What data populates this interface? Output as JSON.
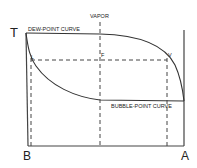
{
  "diagram": {
    "axis_labels": {
      "y": "T",
      "left_bottom": "B",
      "right_bottom": "A"
    },
    "region_label": "VAPOR",
    "curves": {
      "dew_point": "DEW-POINT CURVE",
      "bubble_point": "BUBBLE-POINT CURVE"
    },
    "points": {
      "liquid": "L",
      "feed": "F",
      "vapor": "V"
    },
    "colors": {
      "line": "#333333",
      "background": "#ffffff"
    }
  }
}
